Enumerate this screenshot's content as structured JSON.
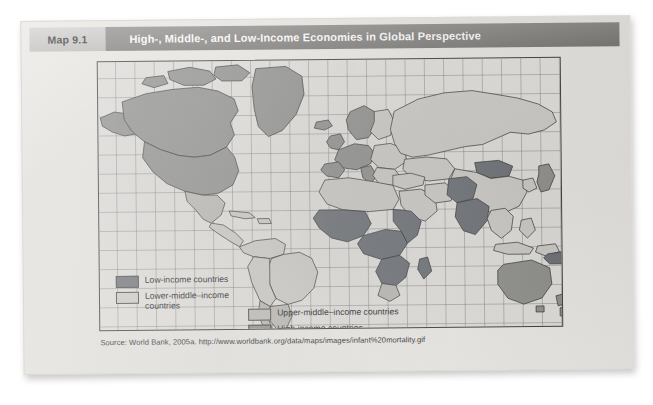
{
  "header": {
    "tab_label": "Map 9.1",
    "title": "High-, Middle-, and Low-Income Economies in Global Perspective"
  },
  "legend": {
    "left_items": [
      {
        "label": "Low-income countries",
        "color": "#6f7378"
      },
      {
        "label": "Lower-middle–income countries",
        "color": "#d4d2cd"
      }
    ],
    "right_items": [
      {
        "label": "Upper-middle–income countries",
        "color": "#c0bfba"
      },
      {
        "label": "High-income countries",
        "color": "#949491"
      },
      {
        "label": "No data",
        "color": "#adaca8"
      }
    ]
  },
  "source": {
    "text": "Source: World Bank, 2005a. http://www.worldbank.org/data/maps/images/infant%20mortality.gif"
  },
  "map": {
    "projection": "world-equirectangular",
    "grid": true,
    "regions": [
      {
        "name": "greenland",
        "category": "high-income"
      },
      {
        "name": "canada",
        "category": "high-income"
      },
      {
        "name": "united-states",
        "category": "high-income"
      },
      {
        "name": "alaska",
        "category": "high-income"
      },
      {
        "name": "mexico",
        "category": "upper-middle-income"
      },
      {
        "name": "central-america",
        "category": "lower-middle-income"
      },
      {
        "name": "caribbean",
        "category": "lower-middle-income"
      },
      {
        "name": "brazil",
        "category": "lower-middle-income"
      },
      {
        "name": "argentina",
        "category": "upper-middle-income"
      },
      {
        "name": "chile",
        "category": "upper-middle-income"
      },
      {
        "name": "andean-states",
        "category": "lower-middle-income"
      },
      {
        "name": "western-europe",
        "category": "high-income"
      },
      {
        "name": "scandinavia",
        "category": "high-income"
      },
      {
        "name": "eastern-europe",
        "category": "lower-middle-income"
      },
      {
        "name": "russia",
        "category": "lower-middle-income"
      },
      {
        "name": "central-asia",
        "category": "lower-middle-income"
      },
      {
        "name": "mongolia",
        "category": "low-income"
      },
      {
        "name": "china",
        "category": "lower-middle-income"
      },
      {
        "name": "japan",
        "category": "high-income"
      },
      {
        "name": "korea",
        "category": "lower-middle-income"
      },
      {
        "name": "india",
        "category": "low-income"
      },
      {
        "name": "pakistan-afghanistan",
        "category": "low-income"
      },
      {
        "name": "southeast-asia",
        "category": "lower-middle-income"
      },
      {
        "name": "indonesia",
        "category": "lower-middle-income"
      },
      {
        "name": "north-africa",
        "category": "lower-middle-income"
      },
      {
        "name": "sahel-west-africa",
        "category": "low-income"
      },
      {
        "name": "central-africa",
        "category": "low-income"
      },
      {
        "name": "east-africa",
        "category": "low-income"
      },
      {
        "name": "southern-africa",
        "category": "low-income"
      },
      {
        "name": "south-africa",
        "category": "upper-middle-income"
      },
      {
        "name": "arabian-peninsula",
        "category": "lower-middle-income"
      },
      {
        "name": "australia",
        "category": "high-income"
      },
      {
        "name": "new-zealand",
        "category": "high-income"
      },
      {
        "name": "papua-new-guinea",
        "category": "low-income"
      }
    ]
  },
  "palette": {
    "low_income": "#6f7378",
    "lower_middle_income": "#d4d2cd",
    "upper_middle_income": "#c0bfba",
    "high_income": "#949491",
    "no_data": "#adaca8",
    "ocean": "#e9e7e3",
    "border": "#3a3a3a",
    "header_bar": "#8e8c89",
    "header_tab": "#c6c4c1",
    "paper": "#eceae6"
  }
}
